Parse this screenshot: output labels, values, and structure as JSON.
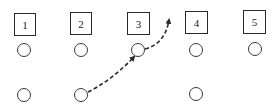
{
  "diagram": {
    "type": "play-diagram",
    "line_color": "#2a2a2a",
    "boxes": [
      {
        "label": "1",
        "x": 14,
        "y": 13,
        "w": 22,
        "h": 23
      },
      {
        "label": "2",
        "x": 70,
        "y": 12,
        "w": 22,
        "h": 23
      },
      {
        "label": "3",
        "x": 127,
        "y": 12,
        "w": 23,
        "h": 23
      },
      {
        "label": "4",
        "x": 185,
        "y": 11,
        "w": 23,
        "h": 23
      },
      {
        "label": "5",
        "x": 243,
        "y": 10,
        "w": 23,
        "h": 24
      }
    ],
    "circles_top_row": [
      {
        "cx": 24,
        "cy": 50,
        "r": 7
      },
      {
        "cx": 81,
        "cy": 50,
        "r": 7
      },
      {
        "cx": 138,
        "cy": 50,
        "r": 7
      },
      {
        "cx": 196,
        "cy": 50,
        "r": 7
      },
      {
        "cx": 255,
        "cy": 49,
        "r": 7
      }
    ],
    "circles_bottom_row": [
      {
        "cx": 24,
        "cy": 95,
        "r": 7
      },
      {
        "cx": 81,
        "cy": 95,
        "r": 7
      },
      {
        "cx": 196,
        "cy": 94,
        "r": 7
      }
    ],
    "arrows": [
      {
        "style": "dashed",
        "from": "bottom circle 2",
        "to": "top circle 3",
        "arrowhead": true
      },
      {
        "style": "dashed",
        "from": "top circle 3",
        "to": "between box 3 and box 4 (upward)",
        "arrowhead": true
      }
    ]
  }
}
